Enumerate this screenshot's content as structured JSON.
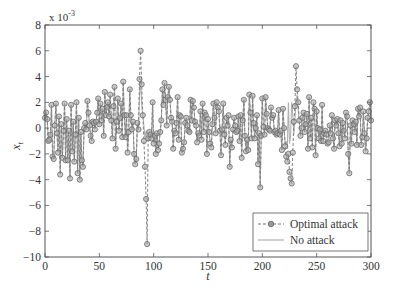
{
  "chart_data": {
    "type": "line",
    "title": "",
    "xlabel": "t",
    "ylabel": "x_t",
    "y_multiplier_label": "x 10",
    "y_multiplier_exp": "-3",
    "xlim": [
      0,
      300
    ],
    "ylim": [
      -10,
      8
    ],
    "xticks": [
      0,
      50,
      100,
      150,
      200,
      250,
      300
    ],
    "yticks": [
      -10,
      -8,
      -6,
      -4,
      -2,
      0,
      2,
      4,
      6,
      8
    ],
    "grid": false,
    "legend_position": "lower right",
    "series": [
      {
        "name": "Optimal attack",
        "style": "dashed-circle-markers",
        "color": "#808080",
        "x_step": 1,
        "values": [
          0.8,
          1.2,
          0.7,
          -1.0,
          -0.9,
          -0.5,
          1.8,
          -2.2,
          -2.4,
          0.2,
          1.9,
          -0.4,
          -1.9,
          0.9,
          -3.6,
          0.3,
          -2.3,
          -0.2,
          1.9,
          -2.5,
          0.7,
          -2.5,
          -0.2,
          -3.9,
          1.8,
          -1.8,
          0.5,
          -2.6,
          -0.5,
          2.0,
          -3.5,
          0.8,
          -4.0,
          -0.3,
          -2.5,
          -3.0,
          0.0,
          0.4,
          -0.1,
          2.1,
          1.2,
          0.2,
          -0.6,
          -1.0,
          0.5,
          0.4,
          -0.1,
          0.5,
          1.2,
          2.3,
          0.3,
          1.9,
          0.6,
          1.5,
          -0.6,
          2.8,
          1.0,
          1.6,
          2.0,
          0.9,
          2.6,
          0.6,
          -0.8,
          1.7,
          3.2,
          -1.6,
          0.5,
          2.3,
          -0.2,
          0.8,
          1.9,
          -0.7,
          3.6,
          1.0,
          -0.7,
          1.0,
          -1.9,
          -0.3,
          3.0,
          1.0,
          -0.1,
          0.5,
          -2.0,
          -2.8,
          -2.4,
          0.4,
          -0.1,
          3.8,
          6.0,
          3.4,
          1.0,
          -1.0,
          -3.0,
          -5.5,
          -9.0,
          -0.8,
          -0.3,
          -0.5,
          -0.8,
          2.0,
          -1.2,
          -0.6,
          -2.0,
          -0.4,
          -1.7,
          -1.2,
          -0.3,
          0.6,
          3.0,
          1.8,
          3.5,
          2.2,
          0.2,
          2.4,
          3.2,
          2.2,
          0.8,
          0.5,
          -1.6,
          -0.2,
          -0.4,
          0.4,
          2.4,
          -0.9,
          1.0,
          0.9,
          -1.9,
          -1.6,
          -1.1,
          0.4,
          0.8,
          0.2,
          -0.2,
          -0.3,
          2.2,
          0.6,
          2.1,
          1.6,
          0.5,
          0.2,
          -1.1,
          -0.4,
          -0.6,
          1.3,
          -0.9,
          1.9,
          -0.3,
          1.2,
          1.0,
          -2.0,
          0.7,
          -0.3,
          -1.2,
          -1.5,
          0.3,
          1.9,
          0.8,
          -0.4,
          2.0,
          1.6,
          1.3,
          -0.2,
          -2.1,
          -0.1,
          1.9,
          -0.5,
          -1.3,
          0.8,
          0.2,
          1.0,
          -3.0,
          -0.9,
          -1.5,
          -0.1,
          0.8,
          0.2,
          -0.3,
          -0.2,
          0.9,
          -1.0,
          1.0,
          -2.3,
          0.6,
          2.2,
          -0.6,
          -1.8,
          -0.9,
          -1.7,
          2.6,
          1.2,
          -0.8,
          2.5,
          0.4,
          -0.8,
          0.0,
          1.0,
          -2.8,
          -0.4,
          -4.6,
          -0.6,
          2.3,
          0.1,
          -0.5,
          2.4,
          1.1,
          0.0,
          -0.1,
          -0.2,
          1.6,
          0.8,
          1.0,
          -0.3,
          -0.2,
          -0.5,
          -0.4,
          1.4,
          -0.5,
          -0.2,
          -1.7,
          1.5,
          0.0,
          -1.4,
          -2.2,
          -2.6,
          -2.0,
          -3.4,
          -3.9,
          -4.3,
          -1.9,
          0.5,
          1.7,
          4.8,
          3.0,
          2.0,
          0.6,
          -0.6,
          0.0,
          0.8,
          1.2,
          -0.3,
          0.3,
          1.1,
          -1.6,
          2.4,
          -0.8,
          0.8,
          -1.5,
          2.0,
          1.5,
          -2.1,
          1.3,
          0.0,
          -0.8,
          -0.1,
          -1.0,
          1.8,
          -1.0,
          -0.4,
          -0.2,
          -0.5,
          -1.2,
          -1.1,
          0.2,
          -0.4,
          1.0,
          -0.8,
          -1.6,
          0.6,
          0.2,
          0.7,
          -0.4,
          -1.4,
          0.6,
          -1.2,
          0.4,
          -0.2,
          -0.8,
          1.2,
          0.9,
          -2.0,
          -3.5,
          0.2,
          -1.2,
          0.6,
          0.3,
          -0.3,
          0.5,
          -1.3,
          1.5,
          0.9,
          1.6,
          -1.3,
          -0.7,
          1.3,
          -0.4,
          -1.8,
          -0.8,
          0.8,
          1.3,
          2.0,
          0.6
        ]
      },
      {
        "name": "No attack",
        "style": "solid",
        "color": "#b0b0b0",
        "x_step": 1,
        "values": [
          0.8,
          1.2,
          0.7,
          -1.0,
          -0.9,
          -0.5,
          1.8,
          -2.2,
          -2.4,
          0.2,
          1.9,
          -0.4,
          -1.9,
          0.9,
          -3.6,
          0.3,
          -2.3,
          -0.2,
          1.9,
          -2.5,
          0.7,
          -2.5,
          -0.2,
          -3.9,
          1.8,
          -1.8,
          0.5,
          -2.6,
          -0.5,
          2.0,
          -3.5,
          0.8,
          -4.0,
          -0.3,
          -2.5,
          -3.0,
          0.0,
          0.4,
          -0.1,
          2.1,
          1.2,
          0.2,
          -0.6,
          -1.0,
          0.5,
          0.4,
          -0.1,
          0.5,
          1.2,
          2.3,
          0.3,
          1.9,
          0.6,
          1.5,
          -0.6,
          2.8,
          1.0,
          1.6,
          2.0,
          0.9,
          2.6,
          0.6,
          -0.8,
          1.7,
          3.2,
          -1.6,
          0.5,
          2.3,
          -0.2,
          0.8,
          1.9,
          -0.7,
          3.6,
          1.0,
          -0.7,
          1.0,
          -1.9,
          -0.3,
          3.0,
          1.0,
          -0.1,
          0.5,
          -2.0,
          -2.8,
          -2.4,
          0.4,
          -0.1,
          2.6,
          3.8,
          1.8,
          1.0,
          0.2,
          -0.8,
          -0.2,
          -0.8,
          -0.8,
          -0.3,
          -0.5,
          -0.8,
          2.0,
          -1.2,
          -0.6,
          -2.0,
          -0.4,
          -1.7,
          -1.2,
          -0.3,
          0.6,
          3.0,
          1.8,
          3.5,
          2.2,
          0.2,
          2.4,
          3.2,
          2.2,
          0.8,
          0.5,
          -1.6,
          -0.2,
          -0.4,
          0.4,
          2.4,
          -0.9,
          1.0,
          0.9,
          -1.9,
          -1.6,
          -1.1,
          0.4,
          0.8,
          0.2,
          -0.2,
          -0.3,
          2.2,
          0.6,
          2.1,
          1.6,
          0.5,
          0.2,
          -1.1,
          -0.4,
          -0.6,
          1.3,
          -0.9,
          1.9,
          -0.3,
          1.2,
          1.0,
          -2.0,
          0.7,
          -0.3,
          -1.2,
          -1.5,
          0.3,
          1.9,
          0.8,
          -0.4,
          2.0,
          1.6,
          1.3,
          -0.2,
          -2.1,
          -0.1,
          1.9,
          -0.5,
          -1.3,
          0.8,
          0.2,
          1.0,
          -3.0,
          -0.9,
          -1.5,
          -0.1,
          0.8,
          0.2,
          -0.3,
          -0.2,
          0.9,
          -1.0,
          1.0,
          -2.3,
          0.6,
          2.2,
          -0.6,
          -1.8,
          -0.9,
          -1.7,
          2.6,
          1.2,
          -0.8,
          2.5,
          0.4,
          -0.8,
          0.0,
          1.0,
          -2.8,
          -0.4,
          -4.6,
          -0.6,
          2.3,
          0.1,
          -0.5,
          2.4,
          1.1,
          0.0,
          -0.1,
          -0.2,
          1.6,
          0.8,
          1.0,
          -0.3,
          -0.2,
          -0.5,
          -0.4,
          1.4,
          -0.5,
          -0.2,
          -1.7,
          1.5,
          0.0,
          -1.4,
          -1.0,
          -1.6,
          2.0,
          -1.2,
          -0.6,
          2.0,
          1.0,
          -0.5,
          0.6,
          1.9,
          2.6,
          1.5,
          0.4,
          -0.6,
          0.0,
          0.8,
          1.2,
          -0.3,
          0.3,
          1.1,
          -1.6,
          2.4,
          -0.8,
          0.8,
          -1.5,
          2.0,
          1.5,
          -2.1,
          1.3,
          0.0,
          -0.8,
          -0.1,
          -1.0,
          1.8,
          -1.0,
          -0.4,
          -0.2,
          -0.5,
          -1.2,
          -1.1,
          0.2,
          -0.4,
          1.0,
          -0.8,
          -1.6,
          0.6,
          0.2,
          0.7,
          -0.4,
          -1.4,
          0.6,
          -1.2,
          0.4,
          -0.2,
          -0.8,
          1.2,
          0.9,
          -2.0,
          -3.5,
          0.2,
          -1.2,
          0.6,
          0.3,
          -0.3,
          0.5,
          -1.3,
          1.5,
          0.9,
          1.6,
          -1.3,
          -0.7,
          1.3,
          -0.4,
          -1.8,
          -0.8,
          0.8,
          1.3,
          2.0,
          0.6
        ]
      }
    ]
  },
  "legend": {
    "items": [
      {
        "label": "Optimal attack"
      },
      {
        "label": "No attack"
      }
    ]
  },
  "axes": {
    "xlabel": "t",
    "ylabel_main": "x",
    "ylabel_sub": "t",
    "multiplier_base": "x 10",
    "multiplier_exp": "-3"
  }
}
